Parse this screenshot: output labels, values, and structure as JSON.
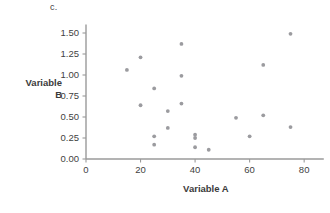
{
  "panel": {
    "label": "c."
  },
  "chart_data": {
    "type": "scatter",
    "title": "",
    "subtitle": "",
    "xlabel": "Variable A",
    "ylabel": "Variable B",
    "ylabel_lines": [
      "Variable",
      "B"
    ],
    "grid": false,
    "legend": null,
    "xlim": [
      0,
      85
    ],
    "ylim": [
      0.0,
      1.6
    ],
    "xticks": [
      0,
      20,
      40,
      60,
      80
    ],
    "xtick_labels": [
      "0",
      "20",
      "40",
      "60",
      "80"
    ],
    "yticks": [
      0.0,
      0.25,
      0.5,
      0.75,
      1.0,
      1.25,
      1.5
    ],
    "ytick_labels": [
      "0.00",
      "0.25",
      "0.50",
      "0.75",
      "1.00",
      "1.25",
      "1.50"
    ],
    "point_color": "#9b9b9f",
    "axis_color": "#9a9a9a",
    "x": [
      15,
      20,
      20,
      25,
      25,
      25,
      30,
      30,
      35,
      35,
      35,
      40,
      40,
      40,
      45,
      55,
      60,
      65,
      65,
      75,
      75
    ],
    "y": [
      1.06,
      1.21,
      0.64,
      0.84,
      0.27,
      0.17,
      0.57,
      0.37,
      1.37,
      0.99,
      0.66,
      0.29,
      0.25,
      0.14,
      0.11,
      0.49,
      0.27,
      1.12,
      0.52,
      1.49,
      0.38
    ],
    "points": [
      {
        "x": 15,
        "y": 1.06
      },
      {
        "x": 20,
        "y": 1.21
      },
      {
        "x": 20,
        "y": 0.64
      },
      {
        "x": 25,
        "y": 0.84
      },
      {
        "x": 25,
        "y": 0.27
      },
      {
        "x": 25,
        "y": 0.17
      },
      {
        "x": 30,
        "y": 0.57
      },
      {
        "x": 30,
        "y": 0.37
      },
      {
        "x": 35,
        "y": 1.37
      },
      {
        "x": 35,
        "y": 0.99
      },
      {
        "x": 35,
        "y": 0.66
      },
      {
        "x": 40,
        "y": 0.29
      },
      {
        "x": 40,
        "y": 0.25
      },
      {
        "x": 40,
        "y": 0.14
      },
      {
        "x": 45,
        "y": 0.11
      },
      {
        "x": 55,
        "y": 0.49
      },
      {
        "x": 60,
        "y": 0.27
      },
      {
        "x": 65,
        "y": 1.12
      },
      {
        "x": 65,
        "y": 0.52
      },
      {
        "x": 75,
        "y": 1.49
      },
      {
        "x": 75,
        "y": 0.38
      }
    ]
  }
}
